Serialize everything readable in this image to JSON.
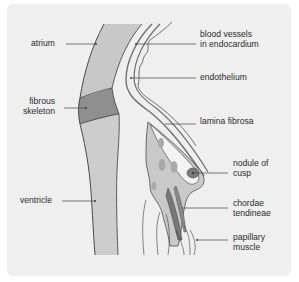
{
  "figure": {
    "colors": {
      "panel_background": "#efefef",
      "atrium_wall": "#c8c8c8",
      "fibrous_skeleton": "#8f8f8f",
      "ventricle_wall": "#cdcdcd",
      "endocardium_line": "#6e6e6e",
      "cusp_fill": "#c9c9c9",
      "cusp_patches": "#a9a9a9",
      "nodule": "#7a7a7a",
      "chordae": "#777777",
      "outline": "#3a3a3a",
      "leader_line": "#555555"
    }
  },
  "labels": {
    "left": [
      {
        "id": "atrium",
        "lines": [
          "atrium"
        ]
      },
      {
        "id": "fibrous-skeleton",
        "lines": [
          "fibrous",
          "skeleton"
        ]
      },
      {
        "id": "ventricle",
        "lines": [
          "ventricle"
        ]
      }
    ],
    "right": [
      {
        "id": "blood-vessels",
        "lines": [
          "blood vessels",
          "in endocardium"
        ]
      },
      {
        "id": "endothelium",
        "lines": [
          "endothelium"
        ]
      },
      {
        "id": "lamina-fibrosa",
        "lines": [
          "lamina fibrosa"
        ]
      },
      {
        "id": "nodule-of-cusp",
        "lines": [
          "nodule of",
          "cusp"
        ]
      },
      {
        "id": "chordae-tendineae",
        "lines": [
          "chordae",
          "tendineae"
        ]
      },
      {
        "id": "papillary-muscle",
        "lines": [
          "papillary",
          "muscle"
        ]
      }
    ]
  }
}
